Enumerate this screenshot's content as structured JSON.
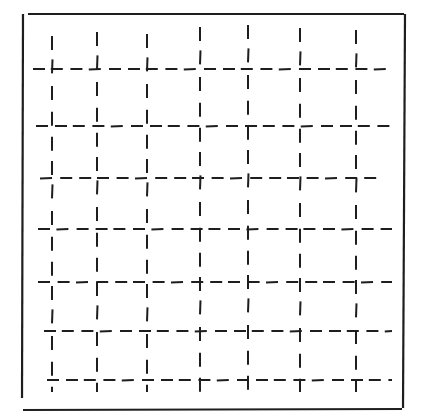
{
  "figure": {
    "width": 423,
    "height": 420,
    "stroke_color": "#1e1e1e",
    "frame": {
      "top": {
        "x1": 28,
        "y1": 14,
        "x2": 404,
        "y2": 14
      },
      "right": {
        "x1": 405,
        "y1": 14,
        "x2": 403,
        "y2": 408
      },
      "left": {
        "x1": 23,
        "y1": 14,
        "x2": 22,
        "y2": 398
      },
      "bottom": {
        "x1": 23,
        "y1": 410,
        "x2": 402,
        "y2": 409
      }
    },
    "grid": {
      "columns_x": [
        52,
        97,
        147,
        200,
        248,
        300,
        356
      ],
      "rows_y": [
        69,
        126,
        178,
        229,
        282,
        331,
        380
      ],
      "row_start_x": [
        33,
        36,
        40,
        38,
        38,
        44,
        47
      ],
      "row_end_x": [
        392,
        392,
        382,
        392,
        392,
        392,
        392
      ],
      "col_start_y": [
        36,
        32,
        34,
        27,
        25,
        28,
        30
      ],
      "col_end_y": [
        392,
        392,
        392,
        397,
        392,
        392,
        392
      ],
      "dash_length": 12,
      "gap_length": 7,
      "col_dash_length": 14,
      "col_gap_length": 11
    }
  }
}
